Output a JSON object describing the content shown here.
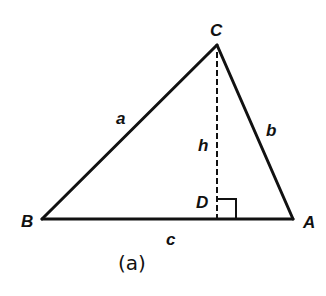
{
  "diagram": {
    "type": "triangle-with-altitude",
    "caption": "(a)",
    "vertices": {
      "A": {
        "label": "A",
        "x": 293,
        "y": 219
      },
      "B": {
        "label": "B",
        "x": 42,
        "y": 219
      },
      "C": {
        "label": "C",
        "x": 217,
        "y": 45
      },
      "D": {
        "label": "D",
        "x": 217,
        "y": 219
      }
    },
    "sides": {
      "a": {
        "label": "a",
        "from": "B",
        "to": "C"
      },
      "b": {
        "label": "b",
        "from": "C",
        "to": "A"
      },
      "c": {
        "label": "c",
        "from": "B",
        "to": "A"
      }
    },
    "altitude": {
      "label": "h",
      "from": "C",
      "to": "D",
      "style": "dashed"
    },
    "right_angle_marker": {
      "at": "D",
      "size": 19
    },
    "colors": {
      "stroke": "#111111",
      "background": "#ffffff"
    }
  }
}
